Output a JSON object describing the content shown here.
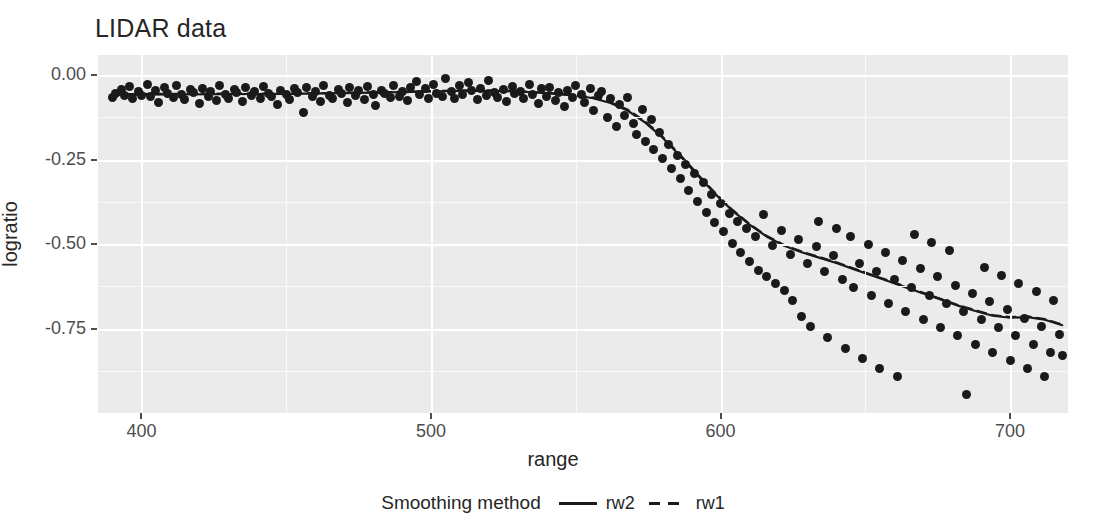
{
  "chart_data": {
    "type": "scatter",
    "title": "LIDAR data",
    "xlabel": "range",
    "ylabel": "logratio",
    "xlim": [
      385,
      720
    ],
    "ylim": [
      -1.0,
      0.06
    ],
    "xticks": [
      400,
      500,
      600,
      700
    ],
    "xtick_labels": [
      "400",
      "500",
      "600",
      "700"
    ],
    "yticks": [
      0.0,
      -0.25,
      -0.5,
      -0.75
    ],
    "ytick_labels": [
      "0.00",
      "-0.25",
      "-0.50",
      "-0.75"
    ],
    "grid": true,
    "legend_position": "bottom",
    "legend_title": "Smoothing method",
    "point_color": "#1a1a1a",
    "panel_color": "#ebebeb",
    "gridline_color": "#ffffff",
    "series": [
      {
        "name": "points",
        "type": "scatter",
        "x": [
          390.0,
          391.0,
          393.0,
          394.0,
          396.0,
          397.0,
          399.0,
          400.0,
          402.0,
          403.0,
          405.0,
          406.0,
          408.0,
          409.0,
          411.0,
          412.0,
          414.0,
          415.0,
          417.0,
          418.0,
          420.0,
          421.0,
          423.0,
          424.0,
          426.0,
          427.0,
          429.0,
          430.0,
          432.0,
          433.0,
          435.0,
          436.0,
          438.0,
          439.0,
          441.0,
          442.0,
          444.0,
          445.0,
          447.0,
          448.0,
          450.0,
          451.0,
          453.0,
          454.0,
          456.0,
          457.0,
          459.0,
          460.0,
          462.0,
          463.0,
          465.0,
          466.0,
          468.0,
          469.0,
          471.0,
          472.0,
          474.0,
          475.0,
          477.0,
          478.0,
          480.0,
          481.0,
          483.0,
          484.0,
          486.0,
          487.0,
          489.0,
          490.0,
          492.0,
          493.0,
          495.0,
          496.0,
          498.0,
          499.0,
          501.0,
          502.0,
          504.0,
          505.0,
          507.0,
          508.0,
          510.0,
          511.0,
          513.0,
          514.0,
          516.0,
          517.0,
          519.0,
          520.0,
          522.0,
          523.0,
          525.0,
          526.0,
          528.0,
          529.0,
          531.0,
          532.0,
          534.0,
          535.0,
          537.0,
          538.0,
          540.0,
          541.0,
          543.0,
          544.0,
          546.0,
          547.0,
          549.0,
          550.0,
          552.0,
          553.0,
          555.0,
          556.0,
          558.0,
          559.0,
          561.0,
          562.0,
          564.0,
          565.0,
          567.0,
          568.0,
          570.0,
          571.0,
          573.0,
          574.0,
          576.0,
          577.0,
          579.0,
          580.0,
          582.0,
          583.0,
          585.0,
          586.0,
          588.0,
          589.0,
          591.0,
          592.0,
          594.0,
          595.0,
          597.0,
          598.0,
          600.0,
          601.0,
          603.0,
          604.0,
          606.0,
          607.0,
          609.0,
          610.0,
          612.0,
          613.0,
          615.0,
          616.0,
          618.0,
          619.0,
          621.0,
          622.0,
          624.0,
          625.0,
          627.0,
          628.0,
          630.0,
          631.0,
          633.0,
          634.0,
          636.0,
          637.0,
          639.0,
          640.0,
          642.0,
          643.0,
          645.0,
          646.0,
          648.0,
          649.0,
          651.0,
          652.0,
          654.0,
          655.0,
          657.0,
          658.0,
          660.0,
          661.0,
          663.0,
          664.0,
          666.0,
          667.0,
          669.0,
          670.0,
          672.0,
          673.0,
          675.0,
          676.0,
          678.0,
          679.0,
          681.0,
          682.0,
          684.0,
          685.0,
          687.0,
          688.0,
          690.0,
          691.0,
          693.0,
          694.0,
          696.0,
          697.0,
          699.0,
          700.0,
          702.0,
          703.0,
          705.0,
          706.0,
          708.0,
          709.0,
          711.0,
          712.0,
          714.0,
          715.0,
          717.0,
          718.0
        ],
        "y": [
          -0.065,
          -0.055,
          -0.041,
          -0.06,
          -0.034,
          -0.07,
          -0.048,
          -0.059,
          -0.028,
          -0.062,
          -0.044,
          -0.081,
          -0.036,
          -0.055,
          -0.066,
          -0.03,
          -0.058,
          -0.072,
          -0.041,
          -0.05,
          -0.083,
          -0.038,
          -0.062,
          -0.049,
          -0.075,
          -0.031,
          -0.057,
          -0.068,
          -0.043,
          -0.052,
          -0.079,
          -0.036,
          -0.061,
          -0.047,
          -0.07,
          -0.033,
          -0.055,
          -0.064,
          -0.088,
          -0.045,
          -0.058,
          -0.072,
          -0.039,
          -0.051,
          -0.111,
          -0.035,
          -0.063,
          -0.048,
          -0.077,
          -0.03,
          -0.059,
          -0.069,
          -0.042,
          -0.054,
          -0.082,
          -0.037,
          -0.06,
          -0.046,
          -0.073,
          -0.032,
          -0.056,
          -0.091,
          -0.044,
          -0.053,
          -0.067,
          -0.029,
          -0.062,
          -0.048,
          -0.076,
          -0.035,
          -0.018,
          -0.058,
          -0.04,
          -0.07,
          -0.026,
          -0.054,
          -0.063,
          -0.011,
          -0.047,
          -0.068,
          -0.031,
          -0.057,
          -0.022,
          -0.045,
          -0.072,
          -0.038,
          -0.06,
          -0.015,
          -0.051,
          -0.066,
          -0.042,
          -0.078,
          -0.033,
          -0.055,
          -0.048,
          -0.069,
          -0.027,
          -0.058,
          -0.085,
          -0.04,
          -0.062,
          -0.036,
          -0.074,
          -0.051,
          -0.093,
          -0.044,
          -0.065,
          -0.029,
          -0.057,
          -0.08,
          -0.038,
          -0.104,
          -0.061,
          -0.047,
          -0.124,
          -0.07,
          -0.152,
          -0.088,
          -0.118,
          -0.066,
          -0.143,
          -0.175,
          -0.102,
          -0.196,
          -0.131,
          -0.219,
          -0.168,
          -0.247,
          -0.205,
          -0.276,
          -0.238,
          -0.305,
          -0.264,
          -0.341,
          -0.292,
          -0.374,
          -0.318,
          -0.405,
          -0.352,
          -0.437,
          -0.381,
          -0.462,
          -0.409,
          -0.497,
          -0.433,
          -0.524,
          -0.455,
          -0.551,
          -0.478,
          -0.578,
          -0.412,
          -0.596,
          -0.503,
          -0.618,
          -0.459,
          -0.636,
          -0.53,
          -0.667,
          -0.485,
          -0.713,
          -0.556,
          -0.744,
          -0.508,
          -0.432,
          -0.58,
          -0.776,
          -0.533,
          -0.455,
          -0.604,
          -0.808,
          -0.477,
          -0.629,
          -0.556,
          -0.838,
          -0.501,
          -0.651,
          -0.581,
          -0.869,
          -0.524,
          -0.676,
          -0.604,
          -0.892,
          -0.548,
          -0.7,
          -0.628,
          -0.471,
          -0.573,
          -0.724,
          -0.652,
          -0.495,
          -0.597,
          -0.748,
          -0.676,
          -0.519,
          -0.622,
          -0.772,
          -0.7,
          -0.945,
          -0.646,
          -0.796,
          -0.724,
          -0.568,
          -0.67,
          -0.82,
          -0.748,
          -0.592,
          -0.695,
          -0.844,
          -0.772,
          -0.617,
          -0.719,
          -0.868,
          -0.796,
          -0.641,
          -0.744,
          -0.891,
          -0.82,
          -0.666,
          -0.768,
          -0.83
        ]
      },
      {
        "name": "rw2",
        "type": "line",
        "linestyle": "solid",
        "x": [
          390,
          410,
          430,
          450,
          470,
          490,
          500,
          510,
          520,
          530,
          540,
          550,
          556,
          562,
          568,
          574,
          580,
          586,
          592,
          598,
          604,
          610,
          616,
          622,
          628,
          634,
          640,
          646,
          652,
          658,
          664,
          670,
          676,
          682,
          688,
          694,
          700,
          706,
          712,
          718
        ],
        "y": [
          -0.058,
          -0.057,
          -0.056,
          -0.055,
          -0.053,
          -0.05,
          -0.048,
          -0.046,
          -0.046,
          -0.048,
          -0.053,
          -0.06,
          -0.068,
          -0.082,
          -0.105,
          -0.14,
          -0.185,
          -0.238,
          -0.295,
          -0.35,
          -0.4,
          -0.442,
          -0.478,
          -0.505,
          -0.524,
          -0.54,
          -0.556,
          -0.574,
          -0.592,
          -0.61,
          -0.628,
          -0.646,
          -0.664,
          -0.682,
          -0.698,
          -0.712,
          -0.718,
          -0.716,
          -0.724,
          -0.74
        ]
      },
      {
        "name": "rw1",
        "type": "line",
        "linestyle": "dashed",
        "x": [
          390,
          410,
          430,
          450,
          470,
          490,
          500,
          510,
          520,
          530,
          540,
          550,
          556,
          562,
          568,
          574,
          580,
          586,
          592,
          598,
          604,
          610,
          616,
          622,
          628,
          634,
          640,
          646,
          652,
          658,
          664,
          670,
          676,
          682,
          688,
          694,
          700,
          706,
          712,
          718
        ],
        "y": [
          -0.056,
          -0.055,
          -0.054,
          -0.054,
          -0.052,
          -0.049,
          -0.047,
          -0.045,
          -0.045,
          -0.047,
          -0.052,
          -0.059,
          -0.066,
          -0.08,
          -0.102,
          -0.137,
          -0.182,
          -0.235,
          -0.292,
          -0.347,
          -0.398,
          -0.44,
          -0.476,
          -0.503,
          -0.522,
          -0.538,
          -0.554,
          -0.572,
          -0.59,
          -0.608,
          -0.626,
          -0.644,
          -0.662,
          -0.68,
          -0.696,
          -0.71,
          -0.716,
          -0.714,
          -0.722,
          -0.738
        ]
      }
    ]
  },
  "legend": {
    "title": "Smoothing method",
    "items": [
      {
        "label": "rw2",
        "style": "solid"
      },
      {
        "label": "rw1",
        "style": "dashed"
      }
    ]
  }
}
